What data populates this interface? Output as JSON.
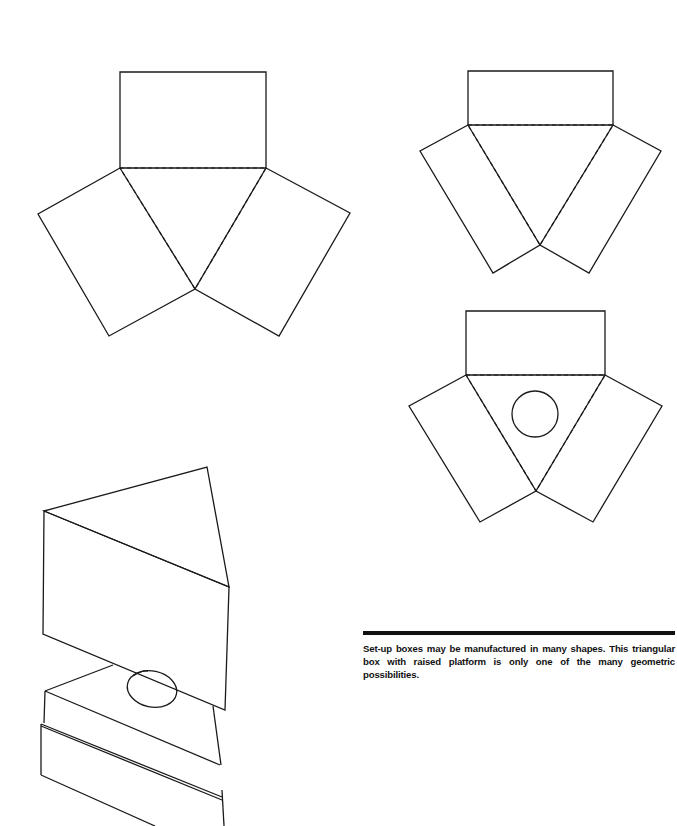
{
  "caption": {
    "text": "Set-up boxes may be manufactured in many shapes. This triangular box with raised platform is only one of the many geometric possibilities."
  },
  "figures": {
    "net_large": "triangular-box-net-large",
    "net_small": "triangular-box-net-small",
    "net_with_hole": "triangular-box-net-with-circle",
    "assembled_box": "assembled-triangular-box-with-raised-platform"
  },
  "colors": {
    "ink": "#1a1a1a",
    "rule": "#111111",
    "background": "#ffffff"
  }
}
